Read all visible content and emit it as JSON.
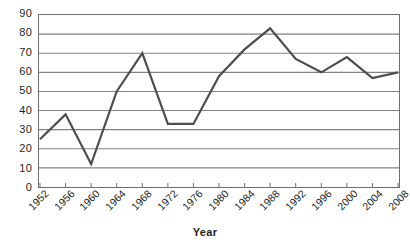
{
  "chart_data": {
    "type": "line",
    "title": "",
    "subtitle": "",
    "xlabel": "Year",
    "ylabel": "",
    "categories": [
      "1952",
      "1956",
      "1960",
      "1964",
      "1968",
      "1972",
      "1976",
      "1980",
      "1984",
      "1988",
      "1992",
      "1996",
      "2000",
      "2004",
      "2008"
    ],
    "values": [
      25,
      38,
      12,
      50,
      70,
      33,
      33,
      58,
      72,
      83,
      67,
      60,
      68,
      57,
      60
    ],
    "series": [
      {
        "name": "",
        "values": [
          25,
          38,
          12,
          50,
          70,
          33,
          33,
          58,
          72,
          83,
          67,
          60,
          68,
          57,
          60
        ]
      }
    ],
    "ylim": [
      0,
      90
    ],
    "ytick_step": 10,
    "yticks": [
      0,
      10,
      20,
      30,
      40,
      50,
      60,
      70,
      80,
      90
    ],
    "ytick_labels": [
      "0",
      "10",
      "20",
      "30",
      "40",
      "50",
      "60",
      "70",
      "80",
      "90"
    ],
    "grid": true,
    "grid_axis": "y",
    "legend": false,
    "legend_position": "none",
    "markers": false,
    "xtick_rotation": -45,
    "colors": {
      "line": "#4d4d4f",
      "grid": "#808285",
      "axis": "#6d6e71",
      "text": "#231f20",
      "background": "#ffffff"
    },
    "line_width": 2.2
  }
}
